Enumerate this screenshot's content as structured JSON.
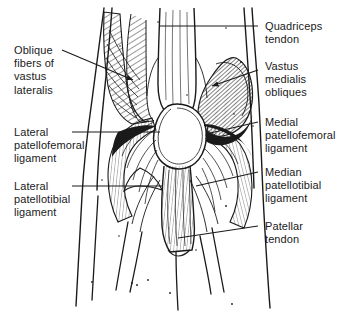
{
  "figure": {
    "kind": "anatomical-line-drawing",
    "view": "anterior",
    "background_color": "#ffffff",
    "ink_color": "#1a1a1a"
  },
  "labels": {
    "left": [
      {
        "id": "oblique-fibers-of-vastus-lateralis",
        "text": "Oblique\nfibers of\nvastus\nlateralis",
        "lines": [
          "Oblique",
          "fibers of",
          "vastus",
          "lateralis"
        ],
        "x": 14,
        "y": 44,
        "leader": "diagonal-arrow"
      },
      {
        "id": "lateral-patellofemoral-ligament",
        "text": "Lateral\npatellofemoral\nligament",
        "lines": [
          "Lateral",
          "patellofemoral",
          "ligament"
        ],
        "x": 14,
        "y": 126,
        "leader": "horizontal"
      },
      {
        "id": "lateral-patellotibial-ligament",
        "text": "Lateral\npatellotibial\nligament",
        "lines": [
          "Lateral",
          "patellotibial",
          "ligament"
        ],
        "x": 14,
        "y": 180,
        "leader": "horizontal"
      }
    ],
    "right": [
      {
        "id": "quadriceps-tendon",
        "text": "Quadriceps\ntendon",
        "lines": [
          "Quadriceps",
          "tendon"
        ],
        "x": 265,
        "y": 20,
        "leader": "horizontal"
      },
      {
        "id": "vastus-medialis-obliques",
        "text": "Vastus\nmedialis\nobliques",
        "lines": [
          "Vastus",
          "medialis",
          "obliques"
        ],
        "x": 265,
        "y": 60,
        "leader": "horizontal"
      },
      {
        "id": "medial-patellofemoral-ligament",
        "text": "Medial\npatellofemoral\nligament",
        "lines": [
          "Medial",
          "patellofemoral",
          "ligament"
        ],
        "x": 265,
        "y": 116,
        "leader": "horizontal"
      },
      {
        "id": "median-patellotibial-ligament",
        "text": "Median\npatellotibial\nligament",
        "lines": [
          "Median",
          "patellotibial",
          "ligament"
        ],
        "x": 265,
        "y": 166,
        "leader": "horizontal"
      },
      {
        "id": "patellar-tendon",
        "text": "Patellar\ntendon",
        "lines": [
          "Patellar",
          "tendon"
        ],
        "x": 265,
        "y": 220,
        "leader": "horizontal"
      }
    ]
  },
  "structures": [
    {
      "id": "patella",
      "name": "Patella",
      "description": "central rounded oval, unshaded"
    },
    {
      "id": "quadriceps-tendon-body",
      "name": "Quadriceps tendon",
      "description": "vertical band above patella"
    },
    {
      "id": "vastus-lateralis-mass",
      "name": "Vastus lateralis",
      "description": "left oblique hatched muscle belly"
    },
    {
      "id": "vastus-medialis-obliquus-mass",
      "name": "Vastus medialis obliquus",
      "description": "right dense hatched muscle bulge"
    },
    {
      "id": "patellar-tendon-body",
      "name": "Patellar tendon",
      "description": "vertical band below patella to tibia"
    },
    {
      "id": "retinaculum-fibers",
      "name": "Retinacular ligament fibers",
      "description": "fine fibers radiating from patella borders"
    }
  ]
}
